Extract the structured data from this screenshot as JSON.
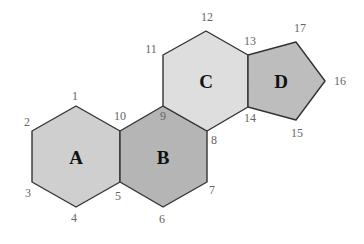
{
  "diagram": {
    "type": "steroid-skeleton-ring-numbering",
    "rings": [
      {
        "id": "A",
        "label": "A",
        "shape": "hexagon",
        "fill": "#cfcfcf",
        "points": [
          [
            76,
            106
          ],
          [
            120,
            131
          ],
          [
            120,
            182
          ],
          [
            76,
            207
          ],
          [
            32,
            182
          ],
          [
            32,
            131
          ]
        ]
      },
      {
        "id": "B",
        "label": "B",
        "shape": "hexagon",
        "fill": "#b5b5b5",
        "points": [
          [
            163,
            106
          ],
          [
            207,
            131
          ],
          [
            207,
            182
          ],
          [
            163,
            207
          ],
          [
            120,
            182
          ],
          [
            120,
            131
          ]
        ]
      },
      {
        "id": "C",
        "label": "C",
        "shape": "hexagon",
        "fill": "#dedede",
        "points": [
          [
            206,
            31
          ],
          [
            248,
            55
          ],
          [
            248,
            107
          ],
          [
            207,
            131
          ],
          [
            163,
            106
          ],
          [
            163,
            55
          ]
        ]
      },
      {
        "id": "D",
        "label": "D",
        "shape": "pentagon",
        "fill": "#bdbdbd",
        "points": [
          [
            248,
            55
          ],
          [
            296,
            42
          ],
          [
            325,
            81
          ],
          [
            296,
            120
          ],
          [
            248,
            107
          ]
        ]
      }
    ],
    "ring_labels": [
      {
        "text": "A",
        "x": 76,
        "y": 157
      },
      {
        "text": "B",
        "x": 163,
        "y": 157
      },
      {
        "text": "C",
        "x": 206,
        "y": 81
      },
      {
        "text": "D",
        "x": 281,
        "y": 81
      }
    ],
    "atom_numbers": [
      {
        "text": "1",
        "x": 75,
        "y": 96
      },
      {
        "text": "2",
        "x": 27,
        "y": 122
      },
      {
        "text": "3",
        "x": 28,
        "y": 193
      },
      {
        "text": "4",
        "x": 74,
        "y": 218
      },
      {
        "text": "5",
        "x": 118,
        "y": 196
      },
      {
        "text": "6",
        "x": 162,
        "y": 219
      },
      {
        "text": "7",
        "x": 212,
        "y": 190
      },
      {
        "text": "8",
        "x": 214,
        "y": 140
      },
      {
        "text": "9",
        "x": 163,
        "y": 116
      },
      {
        "text": "10",
        "x": 120,
        "y": 116
      },
      {
        "text": "11",
        "x": 151,
        "y": 49
      },
      {
        "text": "12",
        "x": 207,
        "y": 17
      },
      {
        "text": "13",
        "x": 250,
        "y": 41
      },
      {
        "text": "14",
        "x": 250,
        "y": 118
      },
      {
        "text": "15",
        "x": 297,
        "y": 133
      },
      {
        "text": "16",
        "x": 340,
        "y": 81
      },
      {
        "text": "17",
        "x": 300,
        "y": 28
      }
    ]
  }
}
